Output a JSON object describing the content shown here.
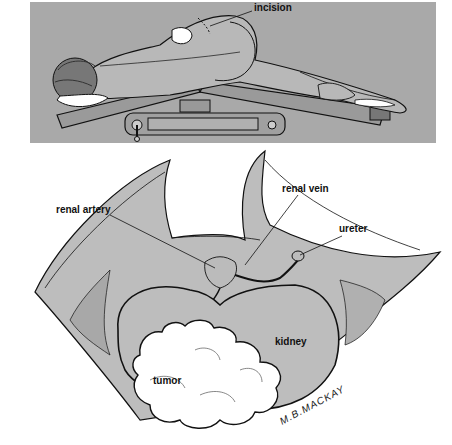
{
  "colors": {
    "panel_bg": "#a9a9a9",
    "skin": "#b8b8b8",
    "tissue": "#bdbdbd",
    "line": "#111111",
    "tumor": "#ffffff"
  },
  "top_panel": {
    "labels": {
      "incision": "incision"
    }
  },
  "bottom_panel": {
    "labels": {
      "renal_artery": "renal artery",
      "renal_vein": "renal vein",
      "ureter": "ureter",
      "kidney": "kidney",
      "tumor": "tumor"
    },
    "signature": "M.B.MACKAY"
  }
}
